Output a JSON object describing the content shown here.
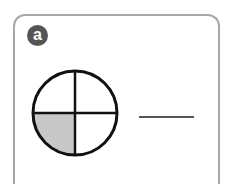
{
  "question": {
    "label": "a",
    "figure": {
      "shape": "circle",
      "parts": 4,
      "shaded_parts": 1,
      "shaded_quadrant": "bottom-left",
      "shade_color": "#c8c8c8"
    },
    "answer_blank": ""
  }
}
